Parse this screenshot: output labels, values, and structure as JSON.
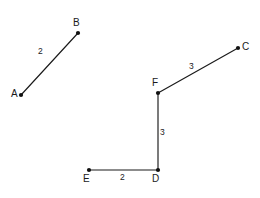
{
  "figure": {
    "background_color": "#ffffff",
    "stroke_color": "#1a1a1a",
    "point_color": "#111111",
    "vertices": [
      {
        "id": "A",
        "label": "A",
        "x": 21,
        "y": 95,
        "label_x": 11,
        "label_y": 89
      },
      {
        "id": "B",
        "label": "B",
        "x": 78,
        "y": 33,
        "label_x": 73,
        "label_y": 18
      },
      {
        "id": "C",
        "label": "C",
        "x": 238,
        "y": 48,
        "label_x": 242,
        "label_y": 42
      },
      {
        "id": "F",
        "label": "F",
        "x": 158,
        "y": 93,
        "label_x": 152,
        "label_y": 78
      },
      {
        "id": "D",
        "label": "D",
        "x": 158,
        "y": 170,
        "label_x": 152,
        "label_y": 174
      },
      {
        "id": "E",
        "label": "E",
        "x": 89,
        "y": 170,
        "label_x": 83,
        "label_y": 174
      }
    ],
    "segments": [
      {
        "id": "AB",
        "from": "A",
        "to": "B",
        "x1": 21,
        "y1": 95,
        "x2": 78,
        "y2": 33
      },
      {
        "id": "FC",
        "from": "F",
        "to": "C",
        "x1": 158,
        "y1": 93,
        "x2": 238,
        "y2": 48
      },
      {
        "id": "FD",
        "from": "F",
        "to": "D",
        "x1": 158,
        "y1": 93,
        "x2": 158,
        "y2": 170
      },
      {
        "id": "ED",
        "from": "E",
        "to": "D",
        "x1": 89,
        "y1": 170,
        "x2": 158,
        "y2": 170
      }
    ],
    "length_labels": [
      {
        "id": "AB",
        "text": "2",
        "x": 38,
        "y": 47
      },
      {
        "id": "FC",
        "text": "3",
        "x": 189,
        "y": 62
      },
      {
        "id": "FD",
        "text": "3",
        "x": 160,
        "y": 128
      },
      {
        "id": "ED",
        "text": "2",
        "x": 120,
        "y": 173
      }
    ]
  }
}
